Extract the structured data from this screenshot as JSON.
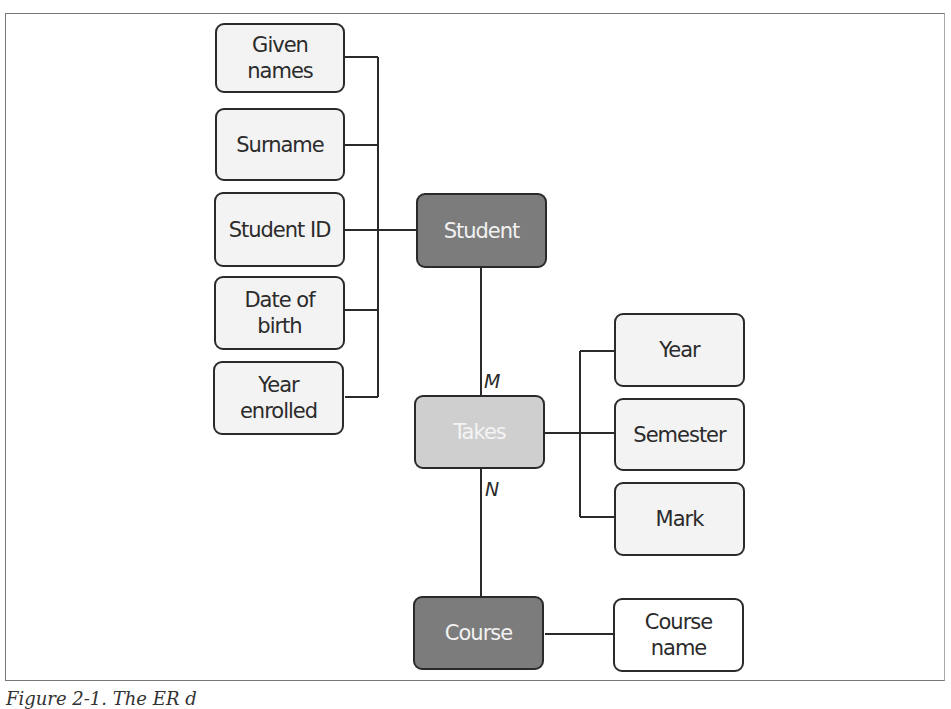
{
  "diagram": {
    "type": "entity-relationship",
    "entities": [
      {
        "id": "student",
        "label": "Student",
        "style": "dark"
      },
      {
        "id": "takes",
        "label": "Takes",
        "style": "light",
        "relationship": true
      },
      {
        "id": "course",
        "label": "Course",
        "style": "dark"
      }
    ],
    "student_attributes": [
      {
        "label": "Given\nnames"
      },
      {
        "label": "Surname"
      },
      {
        "label": "Student ID"
      },
      {
        "label": "Date of\nbirth"
      },
      {
        "label": "Year\nenrolled"
      }
    ],
    "takes_attributes": [
      {
        "label": "Year"
      },
      {
        "label": "Semester"
      },
      {
        "label": "Mark"
      }
    ],
    "course_attributes": [
      {
        "label": "Course\nname"
      }
    ],
    "cardinality": {
      "student_takes": "M",
      "takes_course": "N"
    },
    "colors": {
      "entity_dark": "#7c7c7c",
      "relationship_light": "#cfcfcf",
      "attribute_fill": "#f3f3f3",
      "stroke": "#2a2a2a"
    }
  },
  "caption": "Figure 2-1. The ER d"
}
